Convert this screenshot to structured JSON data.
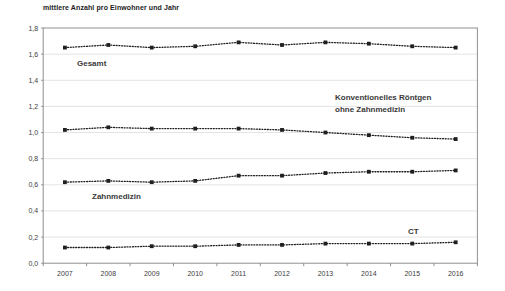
{
  "chart_data": {
    "type": "line",
    "title": "mittlere Anzahl pro Einwohner und Jahr",
    "categories": [
      "2007",
      "2008",
      "2009",
      "2010",
      "2011",
      "2012",
      "2013",
      "2014",
      "2015",
      "2016"
    ],
    "series": [
      {
        "name": "Gesamt",
        "values": [
          1.65,
          1.67,
          1.65,
          1.66,
          1.69,
          1.67,
          1.69,
          1.68,
          1.66,
          1.65
        ],
        "label": {
          "lines": [
            "Gesamt"
          ],
          "x": 77,
          "y": 66,
          "bold": true
        }
      },
      {
        "name": "Konventionelles Röntgen ohne Zahnmedizin",
        "values": [
          1.02,
          1.04,
          1.03,
          1.03,
          1.03,
          1.02,
          1.0,
          0.98,
          0.96,
          0.95
        ],
        "label": {
          "lines": [
            "Konventionelles Röntgen",
            "ohne Zahnmedizin"
          ],
          "x": 335,
          "y": 100,
          "bold": false
        }
      },
      {
        "name": "Zahnmedizin",
        "values": [
          0.62,
          0.63,
          0.62,
          0.63,
          0.67,
          0.67,
          0.69,
          0.7,
          0.7,
          0.71
        ],
        "label": {
          "lines": [
            "Zahnmedizin"
          ],
          "x": 92,
          "y": 199,
          "bold": false
        }
      },
      {
        "name": "CT",
        "values": [
          0.12,
          0.12,
          0.13,
          0.13,
          0.14,
          0.14,
          0.15,
          0.15,
          0.15,
          0.16
        ],
        "label": {
          "lines": [
            "CT"
          ],
          "x": 408,
          "y": 234,
          "bold": false
        }
      }
    ],
    "xlabel": "",
    "ylabel": "",
    "ylim": [
      0,
      1.8
    ],
    "ytick_step": 0.2,
    "ytick_labels": [
      "0,0",
      "0,2",
      "0,4",
      "0,6",
      "0,8",
      "1,0",
      "1,2",
      "1,4",
      "1,6",
      "1,8"
    ],
    "grid": true,
    "legend_position": "inline-labels",
    "line_style": "dotted",
    "marker": "square",
    "colors": {
      "series": "#1f1f1f",
      "labels": "#3a3a3a",
      "grid": "#e4e4e4",
      "axis": "#8f8f8f",
      "tick_text": "#3c3c3c",
      "background": "#ffffff"
    }
  }
}
